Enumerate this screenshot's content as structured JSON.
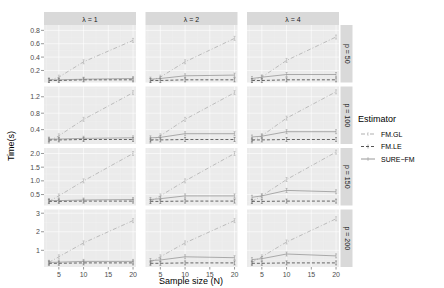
{
  "chart_data": {
    "type": "line",
    "title": "",
    "xlabel": "Sample size (N)",
    "ylabel": "Time(s)",
    "x": [
      3,
      5,
      10,
      20
    ],
    "x_ticks": [
      5,
      10,
      15,
      20
    ],
    "xlim": [
      2,
      20.6
    ],
    "facet_cols": {
      "label": "λ",
      "levels": [
        "λ = 1",
        "λ = 2",
        "λ = 4"
      ]
    },
    "facet_rows": {
      "label": "p",
      "levels": [
        "p = 50",
        "p = 100",
        "p = 150",
        "p = 200"
      ]
    },
    "legend": {
      "title": "Estimator",
      "position": "right",
      "entries": [
        "FM.GL",
        "FM.LE",
        "SURE−FM"
      ]
    },
    "grid": true,
    "rows": [
      {
        "strip": "p = 50",
        "ylim": [
          0.02,
          0.88
        ],
        "y_ticks": [
          0.2,
          0.4,
          0.6,
          0.8
        ],
        "y_tick_labels": [
          "0.2",
          "0.4",
          "0.6",
          "0.8"
        ],
        "panels": [
          {
            "strip": "λ = 1",
            "series": [
              {
                "name": "FM.GL",
                "values": [
                  0.05,
                  0.1,
                  0.33,
                  0.65
                ]
              },
              {
                "name": "FM.LE",
                "values": [
                  0.05,
                  0.05,
                  0.06,
                  0.06
                ]
              },
              {
                "name": "SURE−FM",
                "values": [
                  0.06,
                  0.06,
                  0.07,
                  0.08
                ]
              }
            ]
          },
          {
            "strip": "λ = 2",
            "series": [
              {
                "name": "FM.GL",
                "values": [
                  0.05,
                  0.1,
                  0.33,
                  0.68
                ]
              },
              {
                "name": "FM.LE",
                "values": [
                  0.05,
                  0.05,
                  0.06,
                  0.06
                ]
              },
              {
                "name": "SURE−FM",
                "values": [
                  0.07,
                  0.08,
                  0.12,
                  0.13
                ]
              }
            ]
          },
          {
            "strip": "λ = 4",
            "series": [
              {
                "name": "FM.GL",
                "values": [
                  0.05,
                  0.1,
                  0.35,
                  0.7
                ]
              },
              {
                "name": "FM.LE",
                "values": [
                  0.05,
                  0.05,
                  0.06,
                  0.06
                ]
              },
              {
                "name": "SURE−FM",
                "values": [
                  0.08,
                  0.1,
                  0.14,
                  0.14
                ]
              }
            ]
          }
        ]
      },
      {
        "strip": "p = 100",
        "ylim": [
          0.05,
          1.45
        ],
        "y_ticks": [
          0.4,
          0.8,
          1.2
        ],
        "y_tick_labels": [
          "0.4",
          "0.8",
          "1.2"
        ],
        "panels": [
          {
            "strip": "λ = 1",
            "series": [
              {
                "name": "FM.GL",
                "values": [
                  0.12,
                  0.25,
                  0.65,
                  1.3
                ]
              },
              {
                "name": "FM.LE",
                "values": [
                  0.15,
                  0.15,
                  0.16,
                  0.16
                ]
              },
              {
                "name": "SURE−FM",
                "values": [
                  0.17,
                  0.17,
                  0.19,
                  0.2
                ]
              }
            ]
          },
          {
            "strip": "λ = 2",
            "series": [
              {
                "name": "FM.GL",
                "values": [
                  0.12,
                  0.25,
                  0.65,
                  1.3
                ]
              },
              {
                "name": "FM.LE",
                "values": [
                  0.15,
                  0.15,
                  0.16,
                  0.16
                ]
              },
              {
                "name": "SURE−FM",
                "values": [
                  0.2,
                  0.21,
                  0.3,
                  0.3
                ]
              }
            ]
          },
          {
            "strip": "λ = 4",
            "series": [
              {
                "name": "FM.GL",
                "values": [
                  0.12,
                  0.25,
                  0.68,
                  1.32
                ]
              },
              {
                "name": "FM.LE",
                "values": [
                  0.15,
                  0.15,
                  0.16,
                  0.16
                ]
              },
              {
                "name": "SURE−FM",
                "values": [
                  0.22,
                  0.24,
                  0.35,
                  0.35
                ]
              }
            ]
          }
        ]
      },
      {
        "strip": "p = 150",
        "ylim": [
          0.1,
          2.2
        ],
        "y_ticks": [
          0.5,
          1.0,
          1.5,
          2.0
        ],
        "y_tick_labels": [
          "0.5",
          "1.0",
          "1.5",
          "2.0"
        ],
        "panels": [
          {
            "strip": "λ = 1",
            "series": [
              {
                "name": "FM.GL",
                "values": [
                  0.25,
                  0.45,
                  1.0,
                  2.0
                ]
              },
              {
                "name": "FM.LE",
                "values": [
                  0.25,
                  0.25,
                  0.26,
                  0.26
                ]
              },
              {
                "name": "SURE−FM",
                "values": [
                  0.28,
                  0.28,
                  0.3,
                  0.32
                ]
              }
            ]
          },
          {
            "strip": "λ = 2",
            "series": [
              {
                "name": "FM.GL",
                "values": [
                  0.25,
                  0.45,
                  1.0,
                  2.0
                ]
              },
              {
                "name": "FM.LE",
                "values": [
                  0.25,
                  0.25,
                  0.26,
                  0.26
                ]
              },
              {
                "name": "SURE−FM",
                "values": [
                  0.32,
                  0.35,
                  0.45,
                  0.45
                ]
              }
            ]
          },
          {
            "strip": "λ = 4",
            "series": [
              {
                "name": "FM.GL",
                "values": [
                  0.25,
                  0.45,
                  1.05,
                  2.05
                ]
              },
              {
                "name": "FM.LE",
                "values": [
                  0.25,
                  0.25,
                  0.26,
                  0.26
                ]
              },
              {
                "name": "SURE−FM",
                "values": [
                  0.4,
                  0.45,
                  0.65,
                  0.6
                ]
              }
            ]
          }
        ]
      },
      {
        "strip": "p = 200",
        "ylim": [
          0.1,
          3.2
        ],
        "y_ticks": [
          1,
          2,
          3
        ],
        "y_tick_labels": [
          "1",
          "2",
          "3"
        ],
        "panels": [
          {
            "strip": "λ = 1",
            "series": [
              {
                "name": "FM.GL",
                "values": [
                  0.35,
                  0.65,
                  1.4,
                  2.6
                ]
              },
              {
                "name": "FM.LE",
                "values": [
                  0.3,
                  0.3,
                  0.32,
                  0.32
                ]
              },
              {
                "name": "SURE−FM",
                "values": [
                  0.35,
                  0.36,
                  0.4,
                  0.4
                ]
              }
            ]
          },
          {
            "strip": "λ = 2",
            "series": [
              {
                "name": "FM.GL",
                "values": [
                  0.35,
                  0.65,
                  1.4,
                  2.6
                ]
              },
              {
                "name": "FM.LE",
                "values": [
                  0.3,
                  0.3,
                  0.32,
                  0.32
                ]
              },
              {
                "name": "SURE−FM",
                "values": [
                  0.45,
                  0.48,
                  0.65,
                  0.6
                ]
              }
            ]
          },
          {
            "strip": "λ = 4",
            "series": [
              {
                "name": "FM.GL",
                "values": [
                  0.35,
                  0.65,
                  1.45,
                  2.7
                ]
              },
              {
                "name": "FM.LE",
                "values": [
                  0.3,
                  0.3,
                  0.32,
                  0.32
                ]
              },
              {
                "name": "SURE−FM",
                "values": [
                  0.5,
                  0.55,
                  0.8,
                  0.7
                ]
              }
            ]
          }
        ]
      }
    ]
  },
  "colors": {
    "panel_bg": "#ebebeb",
    "grid_major": "#ffffff",
    "strip_bg": "#d9d9d9",
    "FM.GL": "#a6a6a6",
    "FM.LE": "#555555",
    "SURE−FM": "#8c8c8c"
  }
}
